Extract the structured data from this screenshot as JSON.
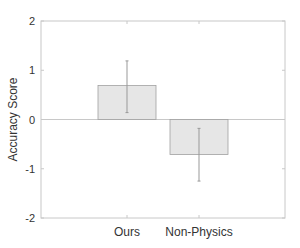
{
  "chart_data": {
    "type": "bar",
    "title": "",
    "xlabel": "",
    "ylabel": "Accuracy Score",
    "categories": [
      "Ours",
      "Non-Physics"
    ],
    "values": [
      0.69,
      -0.71
    ],
    "error_bars": [
      {
        "low": 0.14,
        "high": 1.19
      },
      {
        "low": -1.25,
        "high": -0.18
      }
    ],
    "ylim": [
      -2,
      2
    ],
    "yticks": [
      -2,
      -1,
      0,
      1,
      2
    ],
    "ytick_labels": [
      "-2",
      "-1",
      "0",
      "1",
      "2"
    ],
    "grid": false,
    "zero_line": true,
    "legend": null,
    "colors": {
      "bar_fill": "#e6e6e6",
      "bar_edge": "#a0a0a0",
      "error_bar": "#999999",
      "axis": "#c8c8c8",
      "text": "#333333"
    }
  }
}
